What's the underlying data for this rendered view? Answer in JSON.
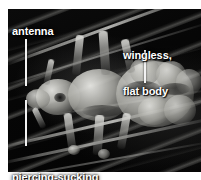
{
  "figure": {
    "background_color": "#ffffff",
    "plate_color": "#060606",
    "label_color": "#ffffff",
    "leader_color": "#f2f2f2"
  },
  "annotations": [
    {
      "id": "antenna",
      "text": "antenna",
      "lines": [
        "antenna"
      ],
      "x": 12,
      "y": 25,
      "leader": {
        "x": 25,
        "y": 39,
        "height": 47
      }
    },
    {
      "id": "wingless-flat-body",
      "text": "wingless, flat body",
      "lines": [
        "wingless,",
        "flat body"
      ],
      "x": 123,
      "y": 25,
      "leader": {
        "x": 144,
        "y": 50,
        "height": 33
      }
    },
    {
      "id": "piercing-sucking-mouthparts",
      "text": "piercing-sucking mouthparts",
      "lines": [
        "piercing-sucking",
        "mouthparts"
      ],
      "x": 12,
      "y": 147,
      "leader": {
        "x": 25,
        "y": 100,
        "height": 46
      }
    }
  ]
}
